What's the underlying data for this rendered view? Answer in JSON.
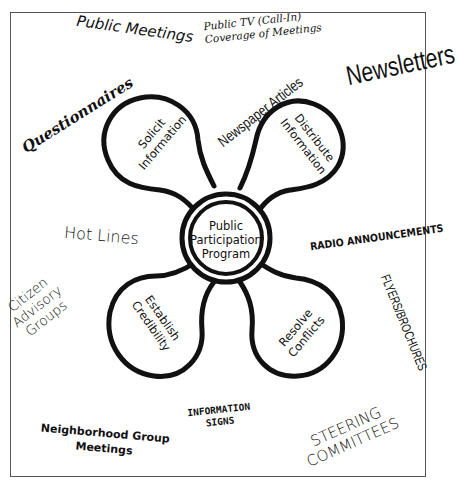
{
  "diagram": {
    "center": {
      "line1": "Public",
      "line2": "Participation",
      "line3": "Program"
    },
    "lobes": [
      {
        "position": "top-left",
        "line1": "Solicit",
        "line2": "Information"
      },
      {
        "position": "top-right",
        "line1": "Distribute",
        "line2": "Information"
      },
      {
        "position": "bottom-left",
        "line1": "Establish",
        "line2": "Credibility"
      },
      {
        "position": "bottom-right",
        "line1": "Resolve",
        "line2": "Conflicts"
      }
    ],
    "methods": {
      "public_meetings": "Public Meetings",
      "public_tv_line1": "Public TV (Call-In)",
      "public_tv_line2": "Coverage of Meetings",
      "newsletters": "Newsletters",
      "questionnaires": "Questionnaires",
      "newspaper_articles": "Newspaper Articles",
      "hot_lines": "Hot Lines",
      "radio_announcements": "RADIO ANNOUNCEMENTS",
      "citizen_line1": "Citizen",
      "citizen_line2": "Advisory",
      "citizen_line3": "Groups",
      "flyers_brochures": "FLYERS/BROCHURES",
      "neighborhood_line1": "Neighborhood Group",
      "neighborhood_line2": "Meetings",
      "information_signs_line1": "INFORMATION",
      "information_signs_line2": "SIGNS",
      "steering_line1": "STEERING",
      "steering_line2": "COMMITTEES"
    },
    "colors": {
      "ink": "#111111",
      "background": "#ffffff",
      "frame": "#555555"
    }
  }
}
